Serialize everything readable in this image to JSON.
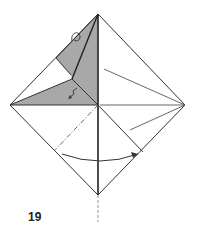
{
  "diagram": {
    "type": "origami-fold-step",
    "step_number": "19",
    "colors": {
      "line": "#333333",
      "shade": "#a8a8a8",
      "paper": "#ffffff"
    },
    "points": {
      "top": [
        98,
        14
      ],
      "left": [
        10,
        105
      ],
      "right": [
        185,
        105
      ],
      "bottom": [
        98,
        195
      ],
      "center": [
        98,
        105
      ]
    },
    "annotations": [
      {
        "kind": "valley-fold-arrow",
        "description": "curved arrow from left to right at lower half"
      },
      {
        "kind": "mountain-fold-line",
        "description": "dash-dot line from center to lower-left edge"
      },
      {
        "kind": "dashed-extension",
        "description": "dashed line below bottom corner"
      },
      {
        "kind": "rotate-arrow",
        "description": "small loop arrow near top-left flap"
      },
      {
        "kind": "pleat-arrow",
        "description": "small zigzag arrow on shaded flap"
      }
    ]
  }
}
